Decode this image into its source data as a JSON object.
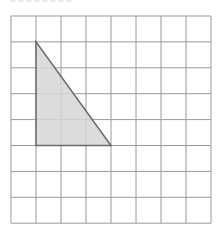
{
  "figure": {
    "type": "grid-with-shaded-right-triangle",
    "grid": {
      "columns": 8,
      "rows": 8,
      "origin_px": [
        11,
        16
      ],
      "cell_width_px": 25,
      "cell_height_px": 25.9,
      "line_color": "#9a9a9a"
    },
    "triangle": {
      "vertices_grid": [
        [
          1,
          1
        ],
        [
          1,
          5
        ],
        [
          4,
          5
        ]
      ],
      "base_units": 3,
      "height_units": 4,
      "fill_color": "#d6d6d6",
      "stroke_color": "#6a6a6a",
      "right_angle_at": "bottom-left"
    }
  }
}
